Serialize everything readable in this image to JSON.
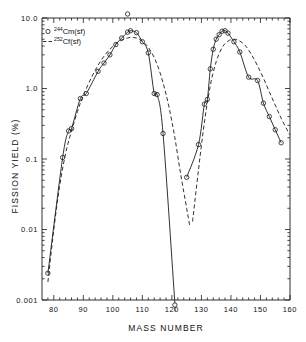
{
  "chart_data": {
    "type": "scatter",
    "title": "",
    "xlabel": "MASS NUMBER",
    "ylabel": "FISSION YIELD (%)",
    "xlim": [
      76,
      160
    ],
    "ylim": [
      0.001,
      10.0
    ],
    "yscale": "log",
    "xscale": "linear",
    "grid": false,
    "legend_position": "top-left",
    "xticks": [
      80,
      90,
      100,
      110,
      120,
      130,
      140,
      150,
      160
    ],
    "xtick_labels": [
      "80",
      "90",
      "100",
      "110",
      "120",
      "130",
      "140",
      "150",
      "160"
    ],
    "xtick_minor_step": 2,
    "yticks": [
      0.001,
      0.01,
      0.1,
      1.0,
      10.0
    ],
    "ytick_labels": [
      "0.001",
      "0.01",
      "0.1",
      "1.0",
      "10.0"
    ],
    "series": [
      {
        "name": "244Cm(sf)",
        "label_main": "Cm(sf)",
        "label_sup": "244",
        "style": "solid-line-with-open-circles",
        "marker": "open-circle",
        "color": "#1a1a1a",
        "points_light_peak": [
          {
            "x": 78,
            "y": 0.0024
          },
          {
            "x": 83,
            "y": 0.105
          },
          {
            "x": 85,
            "y": 0.25
          },
          {
            "x": 86,
            "y": 0.27
          },
          {
            "x": 89,
            "y": 0.72
          },
          {
            "x": 91,
            "y": 0.85
          },
          {
            "x": 95,
            "y": 1.75
          },
          {
            "x": 97,
            "y": 2.3
          },
          {
            "x": 99,
            "y": 3.0
          },
          {
            "x": 101,
            "y": 4.2
          },
          {
            "x": 103,
            "y": 5.2
          },
          {
            "x": 105,
            "y": 6.3
          },
          {
            "x": 106,
            "y": 6.6
          },
          {
            "x": 108,
            "y": 6.2
          },
          {
            "x": 110,
            "y": 4.6
          },
          {
            "x": 112,
            "y": 3.2
          },
          {
            "x": 114,
            "y": 0.85
          },
          {
            "x": 115,
            "y": 0.82
          },
          {
            "x": 117,
            "y": 0.23
          },
          {
            "x": 121,
            "y": 0.0009
          }
        ],
        "points_heavy_peak": [
          {
            "x": 125,
            "y": 0.055
          },
          {
            "x": 129,
            "y": 0.16
          },
          {
            "x": 131,
            "y": 0.6
          },
          {
            "x": 132,
            "y": 0.7
          },
          {
            "x": 133,
            "y": 1.9
          },
          {
            "x": 134,
            "y": 3.6
          },
          {
            "x": 135,
            "y": 5.0
          },
          {
            "x": 136,
            "y": 5.8
          },
          {
            "x": 137,
            "y": 6.5
          },
          {
            "x": 138,
            "y": 6.6
          },
          {
            "x": 139,
            "y": 6.1
          },
          {
            "x": 141,
            "y": 4.6
          },
          {
            "x": 143,
            "y": 3.3
          },
          {
            "x": 146,
            "y": 1.45
          },
          {
            "x": 149,
            "y": 1.3
          },
          {
            "x": 151,
            "y": 0.62
          },
          {
            "x": 153,
            "y": 0.4
          },
          {
            "x": 155,
            "y": 0.26
          },
          {
            "x": 157,
            "y": 0.17
          }
        ]
      },
      {
        "name": "252Cf(sf)",
        "label_main": "Cf(sf)",
        "label_sup": "252",
        "style": "dashed-line",
        "marker": "none",
        "color": "#1a1a1a",
        "curve_light_peak": [
          {
            "x": 78,
            "y": 0.0018
          },
          {
            "x": 80,
            "y": 0.01
          },
          {
            "x": 82,
            "y": 0.042
          },
          {
            "x": 84,
            "y": 0.12
          },
          {
            "x": 86,
            "y": 0.25
          },
          {
            "x": 88,
            "y": 0.47
          },
          {
            "x": 90,
            "y": 0.8
          },
          {
            "x": 93,
            "y": 1.5
          },
          {
            "x": 96,
            "y": 2.5
          },
          {
            "x": 99,
            "y": 3.6
          },
          {
            "x": 102,
            "y": 4.6
          },
          {
            "x": 105,
            "y": 5.2
          },
          {
            "x": 107,
            "y": 5.3
          },
          {
            "x": 109,
            "y": 5.0
          },
          {
            "x": 111,
            "y": 4.3
          },
          {
            "x": 113,
            "y": 3.3
          },
          {
            "x": 115,
            "y": 2.2
          },
          {
            "x": 117,
            "y": 1.2
          },
          {
            "x": 119,
            "y": 0.55
          },
          {
            "x": 121,
            "y": 0.2
          },
          {
            "x": 123,
            "y": 0.06
          },
          {
            "x": 125,
            "y": 0.02
          },
          {
            "x": 126,
            "y": 0.0115
          }
        ],
        "curve_heavy_peak": [
          {
            "x": 127,
            "y": 0.013
          },
          {
            "x": 129,
            "y": 0.07
          },
          {
            "x": 131,
            "y": 0.33
          },
          {
            "x": 133,
            "y": 1.1
          },
          {
            "x": 135,
            "y": 2.4
          },
          {
            "x": 137,
            "y": 3.8
          },
          {
            "x": 139,
            "y": 4.7
          },
          {
            "x": 141,
            "y": 5.0
          },
          {
            "x": 143,
            "y": 4.7
          },
          {
            "x": 145,
            "y": 4.0
          },
          {
            "x": 147,
            "y": 3.0
          },
          {
            "x": 149,
            "y": 2.1
          },
          {
            "x": 151,
            "y": 1.4
          },
          {
            "x": 153,
            "y": 0.9
          },
          {
            "x": 155,
            "y": 0.58
          },
          {
            "x": 157,
            "y": 0.38
          },
          {
            "x": 159,
            "y": 0.26
          },
          {
            "x": 160,
            "y": 0.22
          }
        ]
      }
    ],
    "annotations": [
      {
        "text": "off-scale-point-above-top-axis",
        "x": 105,
        "note": "open circle plotted at/above 10.0 near mass 105"
      },
      {
        "text": "upper-limit-point-below-bottom-axis",
        "x": 121,
        "note": "open circle at/below 0.001 near mass 121"
      }
    ]
  },
  "legend": {
    "entries": [
      {
        "marker_glyph": "open-circle",
        "sup": "244",
        "text": "Cm(sf)"
      },
      {
        "marker_glyph": "dashed-line",
        "sup": "252",
        "text": "Cf(sf)"
      }
    ]
  },
  "colors": {
    "axis": "#1a1a1a",
    "curve": "#1a1a1a",
    "background": "#ffffff"
  }
}
